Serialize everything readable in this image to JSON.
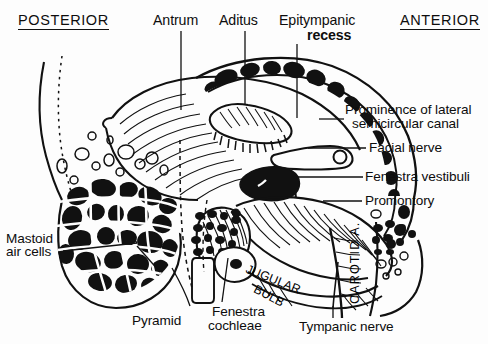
{
  "figure": {
    "ink_color": "#111111",
    "paper_color": "#fdfdfd"
  },
  "orientation": {
    "posterior": "POSTERIOR",
    "anterior": "ANTERIOR"
  },
  "labels": {
    "antrum": "Antrum",
    "aditus": "Aditus",
    "epitympanic_line1": "Epitympanic",
    "epitympanic_line2": "recess",
    "prominence_line1": "Prominence of lateral",
    "prominence_line2": "semicircular canal",
    "facial_nerve": "Facial nerve",
    "fenestra_vestibuli": "Fenestra vestibuli",
    "promontory": "Promontory",
    "mastoid_line1": "Mastoid",
    "mastoid_line2": "air cells",
    "pyramid": "Pyramid",
    "fenestra_cochleae_line1": "Fenestra",
    "fenestra_cochleae_line2": "cochleae",
    "tympanic_nerve": "Tympanic nerve",
    "jugular_bulb_line1": "JUGULAR",
    "jugular_bulb_line2": "BULB",
    "carotid_artery": "CAROTID A."
  }
}
